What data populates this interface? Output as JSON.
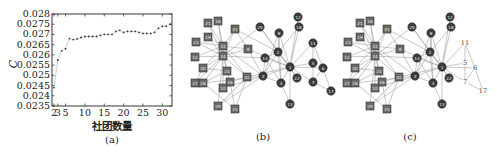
{
  "chart_data": [
    {
      "panel": "(a)",
      "type": "line",
      "title": "",
      "xlabel": "社团数量",
      "ylabel": "C",
      "caption": "(a)",
      "xlim": [
        1.5,
        32.5
      ],
      "ylim": [
        0.0235,
        0.028
      ],
      "x_ticks": [
        2,
        3,
        5,
        10,
        15,
        20,
        25,
        30
      ],
      "x_tick_labels": [
        "2",
        "3",
        "5",
        "10",
        "15",
        "20",
        "25",
        "30"
      ],
      "y_ticks": [
        0.0235,
        0.024,
        0.0245,
        0.025,
        0.0255,
        0.026,
        0.0265,
        0.027,
        0.0275,
        0.028
      ],
      "y_tick_labels": [
        "0.0235",
        "0.024",
        "0.0245",
        "0.025",
        "0.0255",
        "0.026",
        "0.0265",
        "0.027",
        "0.0275",
        "0.028"
      ],
      "grid": false,
      "marker": "dot",
      "x": [
        2,
        3,
        4,
        5,
        6,
        7,
        8,
        9,
        10,
        11,
        12,
        13,
        14,
        15,
        16,
        17,
        18,
        19,
        20,
        21,
        22,
        23,
        24,
        25,
        26,
        27,
        28,
        29,
        30,
        31,
        32
      ],
      "values": [
        0.0244,
        0.02575,
        0.0262,
        0.0263,
        0.0268,
        0.02675,
        0.02678,
        0.02685,
        0.0269,
        0.0269,
        0.0269,
        0.0269,
        0.02695,
        0.027,
        0.027,
        0.027,
        0.02715,
        0.0272,
        0.0271,
        0.02715,
        0.02715,
        0.02715,
        0.0271,
        0.02705,
        0.02705,
        0.02705,
        0.0271,
        0.0273,
        0.0274,
        0.0274,
        0.0275
      ]
    },
    {
      "panel": "(b)",
      "type": "network",
      "caption": "(b)",
      "nodes": [
        {
          "id": "21",
          "shape": "square",
          "x": 208,
          "y": 23
        },
        {
          "id": "16",
          "shape": "square",
          "x": 218,
          "y": 21
        },
        {
          "id": "31",
          "shape": "square",
          "x": 235,
          "y": 29
        },
        {
          "id": "19",
          "shape": "square",
          "x": 208,
          "y": 37
        },
        {
          "id": "23",
          "shape": "square",
          "x": 196,
          "y": 42
        },
        {
          "id": "33",
          "shape": "square",
          "x": 223,
          "y": 46
        },
        {
          "id": "9",
          "shape": "square",
          "x": 248,
          "y": 49
        },
        {
          "id": "15",
          "shape": "square",
          "x": 195,
          "y": 57
        },
        {
          "id": "34",
          "shape": "square",
          "x": 223,
          "y": 56
        },
        {
          "id": "30",
          "shape": "square",
          "x": 203,
          "y": 68
        },
        {
          "id": "24",
          "shape": "square",
          "x": 227,
          "y": 71
        },
        {
          "id": "32",
          "shape": "square",
          "x": 247,
          "y": 77
        },
        {
          "id": "27",
          "shape": "square",
          "x": 195,
          "y": 83
        },
        {
          "id": "28",
          "shape": "square",
          "x": 203,
          "y": 83
        },
        {
          "id": "26",
          "shape": "square",
          "x": 230,
          "y": 82
        },
        {
          "id": "10",
          "shape": "square",
          "x": 223,
          "y": 88
        },
        {
          "id": "29",
          "shape": "square",
          "x": 218,
          "y": 106
        },
        {
          "id": "25",
          "shape": "square",
          "x": 235,
          "y": 109
        },
        {
          "id": "20",
          "shape": "circle",
          "x": 260,
          "y": 27
        },
        {
          "id": "8",
          "shape": "circle",
          "x": 279,
          "y": 33
        },
        {
          "id": "12",
          "shape": "circle",
          "x": 298,
          "y": 17
        },
        {
          "id": "18",
          "shape": "circle",
          "x": 299,
          "y": 27
        },
        {
          "id": "11",
          "shape": "circle",
          "x": 313,
          "y": 43
        },
        {
          "id": "2",
          "shape": "circle",
          "x": 278,
          "y": 52
        },
        {
          "id": "14",
          "shape": "circle",
          "x": 265,
          "y": 58
        },
        {
          "id": "1",
          "shape": "circle",
          "x": 290,
          "y": 67
        },
        {
          "id": "5",
          "shape": "circle",
          "x": 313,
          "y": 63
        },
        {
          "id": "6",
          "shape": "circle",
          "x": 323,
          "y": 68
        },
        {
          "id": "3",
          "shape": "circle",
          "x": 263,
          "y": 76
        },
        {
          "id": "4",
          "shape": "circle",
          "x": 281,
          "y": 83
        },
        {
          "id": "22",
          "shape": "circle",
          "x": 297,
          "y": 78
        },
        {
          "id": "7",
          "shape": "circle",
          "x": 313,
          "y": 82
        },
        {
          "id": "17",
          "shape": "circle",
          "x": 331,
          "y": 91
        },
        {
          "id": "13",
          "shape": "circle",
          "x": 290,
          "y": 104
        }
      ],
      "edges": [
        [
          "1",
          "2"
        ],
        [
          "1",
          "3"
        ],
        [
          "1",
          "4"
        ],
        [
          "1",
          "5"
        ],
        [
          "1",
          "6"
        ],
        [
          "1",
          "7"
        ],
        [
          "1",
          "8"
        ],
        [
          "1",
          "9"
        ],
        [
          "1",
          "11"
        ],
        [
          "1",
          "12"
        ],
        [
          "1",
          "13"
        ],
        [
          "1",
          "14"
        ],
        [
          "1",
          "18"
        ],
        [
          "1",
          "20"
        ],
        [
          "1",
          "22"
        ],
        [
          "1",
          "32"
        ],
        [
          "2",
          "3"
        ],
        [
          "2",
          "4"
        ],
        [
          "2",
          "8"
        ],
        [
          "2",
          "14"
        ],
        [
          "2",
          "18"
        ],
        [
          "2",
          "20"
        ],
        [
          "2",
          "22"
        ],
        [
          "2",
          "31"
        ],
        [
          "3",
          "4"
        ],
        [
          "3",
          "8"
        ],
        [
          "3",
          "9"
        ],
        [
          "3",
          "10"
        ],
        [
          "3",
          "14"
        ],
        [
          "3",
          "28"
        ],
        [
          "3",
          "29"
        ],
        [
          "3",
          "33"
        ],
        [
          "4",
          "8"
        ],
        [
          "4",
          "13"
        ],
        [
          "4",
          "14"
        ],
        [
          "5",
          "7"
        ],
        [
          "5",
          "11"
        ],
        [
          "6",
          "7"
        ],
        [
          "6",
          "11"
        ],
        [
          "6",
          "17"
        ],
        [
          "7",
          "17"
        ],
        [
          "9",
          "31"
        ],
        [
          "9",
          "33"
        ],
        [
          "9",
          "34"
        ],
        [
          "10",
          "34"
        ],
        [
          "14",
          "34"
        ],
        [
          "15",
          "33"
        ],
        [
          "15",
          "34"
        ],
        [
          "16",
          "33"
        ],
        [
          "16",
          "34"
        ],
        [
          "19",
          "33"
        ],
        [
          "19",
          "34"
        ],
        [
          "20",
          "34"
        ],
        [
          "21",
          "33"
        ],
        [
          "21",
          "34"
        ],
        [
          "23",
          "33"
        ],
        [
          "23",
          "34"
        ],
        [
          "24",
          "26"
        ],
        [
          "24",
          "28"
        ],
        [
          "24",
          "30"
        ],
        [
          "24",
          "33"
        ],
        [
          "24",
          "34"
        ],
        [
          "25",
          "26"
        ],
        [
          "25",
          "28"
        ],
        [
          "25",
          "32"
        ],
        [
          "26",
          "32"
        ],
        [
          "27",
          "30"
        ],
        [
          "27",
          "34"
        ],
        [
          "28",
          "34"
        ],
        [
          "29",
          "32"
        ],
        [
          "29",
          "34"
        ],
        [
          "30",
          "33"
        ],
        [
          "30",
          "34"
        ],
        [
          "31",
          "33"
        ],
        [
          "31",
          "34"
        ],
        [
          "32",
          "33"
        ],
        [
          "32",
          "34"
        ],
        [
          "33",
          "34"
        ]
      ]
    },
    {
      "panel": "(c)",
      "type": "network",
      "caption": "(c)",
      "offset_x": 152,
      "plain_nodes": [
        "11",
        "5",
        "6",
        "7",
        "17"
      ]
    }
  ]
}
